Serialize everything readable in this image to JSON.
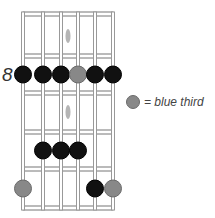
{
  "diagram": {
    "type": "guitar-scale-fretboard",
    "fret_label": "8",
    "legend": {
      "text": "= blue third",
      "dot_color": "#888888"
    },
    "colors": {
      "note": "#111111",
      "blue_third": "#888888",
      "fret": "#777777",
      "string": "#999999"
    },
    "strings_x": [
      23,
      43,
      61,
      78,
      95,
      113
    ],
    "frets_y": [
      14,
      56,
      93,
      132,
      169,
      208
    ],
    "inlays": [
      {
        "x": 68,
        "y": 36
      },
      {
        "x": 68,
        "y": 112
      }
    ],
    "notes": [
      {
        "string": 1,
        "fret_row": 2,
        "type": "root"
      },
      {
        "string": 2,
        "fret_row": 2,
        "type": "root"
      },
      {
        "string": 3,
        "fret_row": 2,
        "type": "root"
      },
      {
        "string": 4,
        "fret_row": 2,
        "type": "blue_third"
      },
      {
        "string": 5,
        "fret_row": 2,
        "type": "root"
      },
      {
        "string": 6,
        "fret_row": 2,
        "type": "root"
      },
      {
        "string": 2,
        "fret_row": 4,
        "type": "root"
      },
      {
        "string": 3,
        "fret_row": 4,
        "type": "root"
      },
      {
        "string": 4,
        "fret_row": 4,
        "type": "root"
      },
      {
        "string": 1,
        "fret_row": 5,
        "type": "blue_third"
      },
      {
        "string": 5,
        "fret_row": 5,
        "type": "root"
      },
      {
        "string": 6,
        "fret_row": 5,
        "type": "blue_third"
      }
    ]
  }
}
